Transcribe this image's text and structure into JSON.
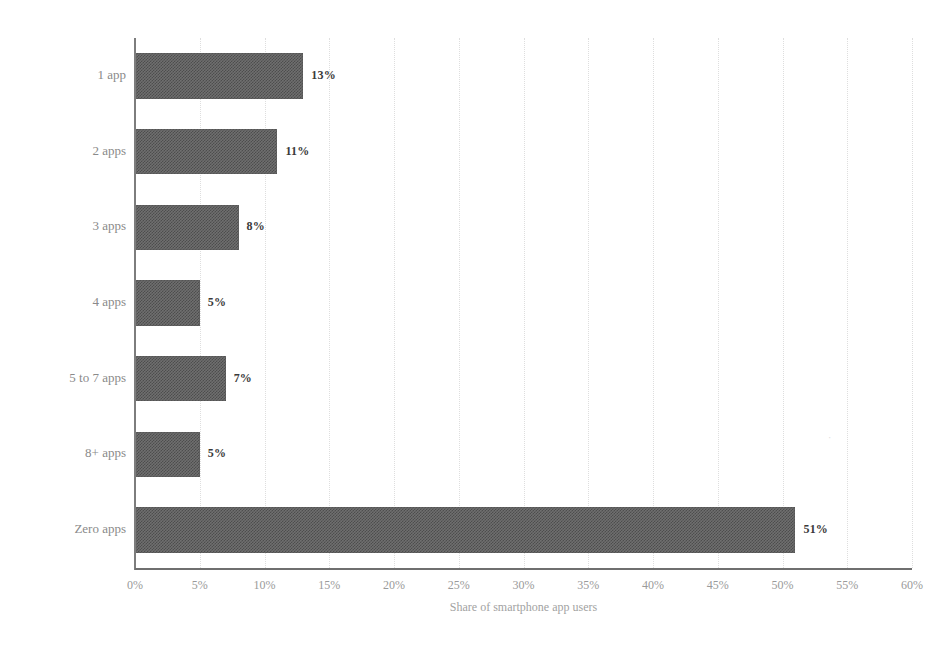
{
  "chart_data": {
    "type": "bar",
    "orientation": "horizontal",
    "title": "",
    "subtitle": "",
    "xlabel": "Share of smartphone app users",
    "ylabel": "",
    "categories": [
      "1 app",
      "2 apps",
      "3 apps",
      "4 apps",
      "5 to 7 apps",
      "8+ apps",
      "Zero apps"
    ],
    "values": [
      13,
      11,
      8,
      5,
      7,
      5,
      51
    ],
    "value_labels": [
      "13%",
      "11%",
      "8%",
      "5%",
      "7%",
      "5%",
      "51%"
    ],
    "xlim": [
      0,
      60
    ],
    "xticks": [
      0,
      5,
      10,
      15,
      20,
      25,
      30,
      35,
      40,
      45,
      50,
      55,
      60
    ],
    "xticklabels": [
      "0%",
      "5%",
      "10%",
      "15%",
      "20%",
      "25%",
      "30%",
      "35%",
      "40%",
      "45%",
      "50%",
      "55%",
      "60%"
    ],
    "grid": "vertical-dotted",
    "legend": "none",
    "series": [
      {
        "name": "Share of smartphone app users",
        "values": [
          13,
          11,
          8,
          5,
          7,
          5,
          51
        ]
      }
    ],
    "colors": {
      "bar_fill": "#6f6f6f",
      "bar_dither_dark": "#4d4d4d",
      "gridline": "#dedede",
      "axis": "#7d7d7d",
      "value_label": "#3a3a3a",
      "tick_label": "#9a9a9a",
      "category_label": "#8a8a8a",
      "axis_title": "#a2a2a2",
      "background": "#ffffff"
    }
  },
  "axis": {
    "x_title": "Share of smartphone app users"
  }
}
